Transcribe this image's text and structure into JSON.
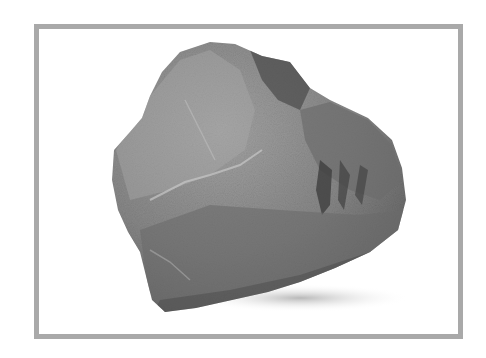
{
  "image": {
    "subject": "gray rock",
    "alt": "Photograph of a single rough gray rock on a white background inside a gray frame",
    "frame_color": "#a9a9a9",
    "background_color": "#ffffff",
    "rock_base_color": "#8a8a8a",
    "rock_dark_color": "#4a4a4a",
    "rock_highlight_color": "#b8b8b8"
  }
}
